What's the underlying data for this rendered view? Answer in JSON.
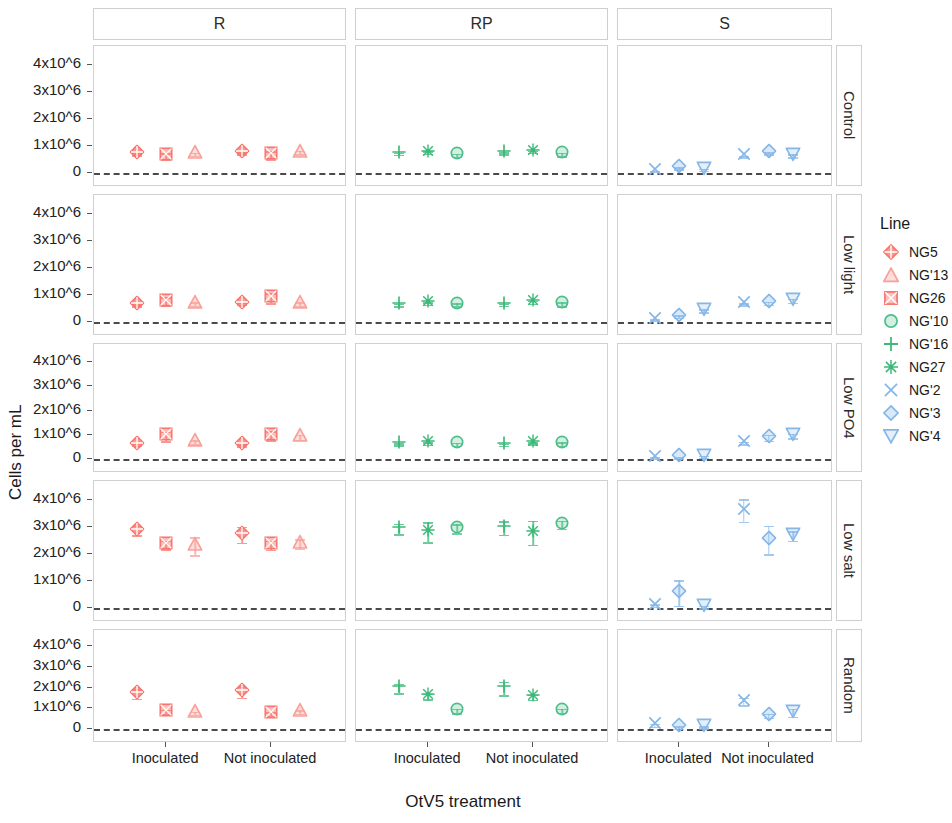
{
  "figure": {
    "axis_title_x": "OtV5 treatment",
    "axis_title_y": "Cells per mL",
    "legend_title": "Line"
  },
  "chart_data": {
    "type": "scatter",
    "title": "",
    "xlabel": "OtV5 treatment",
    "ylabel": "Cells per mL",
    "ylim": [
      0,
      4500000
    ],
    "yticks": [
      0,
      1000000,
      2000000,
      3000000,
      4000000
    ],
    "ytick_labels": [
      "0",
      "1x10^6",
      "2x10^6",
      "3x10^6",
      "4x10^6"
    ],
    "x_categories": [
      "Inoculated",
      "Not inoculated"
    ],
    "grid": false,
    "legend_position": "right",
    "reference_line": {
      "y": 0,
      "style": "dashed",
      "color": "#4a4a4a"
    },
    "facet_columns": [
      "R",
      "RP",
      "S"
    ],
    "facet_rows": [
      "Control",
      "Low light",
      "Low PO4",
      "Low salt",
      "Random"
    ],
    "legend": [
      {
        "name": "NG5",
        "marker": "diamond-plus",
        "color": "#F8766D",
        "filled": true
      },
      {
        "name": "NG'13",
        "marker": "triangle",
        "color": "#F8A19B",
        "filled": false
      },
      {
        "name": "NG26",
        "marker": "square-x",
        "color": "#F8766D",
        "filled": false
      },
      {
        "name": "NG'10",
        "marker": "circle-open",
        "color": "#4DBE8A",
        "filled": false
      },
      {
        "name": "NG'16",
        "marker": "plus",
        "color": "#3CB878",
        "filled": true
      },
      {
        "name": "NG27",
        "marker": "asterisk",
        "color": "#3CB878",
        "filled": true
      },
      {
        "name": "NG'2",
        "marker": "x",
        "color": "#84B7E8",
        "filled": true
      },
      {
        "name": "NG'3",
        "marker": "diamond-open",
        "color": "#84B7E8",
        "filled": false
      },
      {
        "name": "NG'4",
        "marker": "triangle-down-open",
        "color": "#84B7E8",
        "filled": false
      }
    ],
    "series": [
      {
        "facet_col": "R",
        "facet_row": "Control",
        "points": [
          {
            "line": "NG5",
            "x": "Inoculated",
            "y": 700000,
            "err": 40000
          },
          {
            "line": "NG26",
            "x": "Inoculated",
            "y": 620000,
            "err": 120000
          },
          {
            "line": "NG'13",
            "x": "Inoculated",
            "y": 700000,
            "err": 60000
          },
          {
            "line": "NG5",
            "x": "Not inoculated",
            "y": 740000,
            "err": 40000
          },
          {
            "line": "NG26",
            "x": "Not inoculated",
            "y": 660000,
            "err": 140000
          },
          {
            "line": "NG'13",
            "x": "Not inoculated",
            "y": 760000,
            "err": 70000
          }
        ]
      },
      {
        "facet_col": "RP",
        "facet_row": "Control",
        "points": [
          {
            "line": "NG'16",
            "x": "Inoculated",
            "y": 720000,
            "err": 40000
          },
          {
            "line": "NG27",
            "x": "Inoculated",
            "y": 760000,
            "err": 40000
          },
          {
            "line": "NG'10",
            "x": "Inoculated",
            "y": 660000,
            "err": 60000
          },
          {
            "line": "NG'16",
            "x": "Not inoculated",
            "y": 730000,
            "err": 40000
          },
          {
            "line": "NG27",
            "x": "Not inoculated",
            "y": 790000,
            "err": 40000
          },
          {
            "line": "NG'10",
            "x": "Not inoculated",
            "y": 690000,
            "err": 70000
          }
        ]
      },
      {
        "facet_col": "S",
        "facet_row": "Control",
        "points": [
          {
            "line": "NG'2",
            "x": "Inoculated",
            "y": 60000,
            "err": 20000
          },
          {
            "line": "NG'3",
            "x": "Inoculated",
            "y": 180000,
            "err": 40000
          },
          {
            "line": "NG'4",
            "x": "Inoculated",
            "y": 120000,
            "err": 40000
          },
          {
            "line": "NG'2",
            "x": "Not inoculated",
            "y": 620000,
            "err": 30000
          },
          {
            "line": "NG'3",
            "x": "Not inoculated",
            "y": 740000,
            "err": 40000
          },
          {
            "line": "NG'4",
            "x": "Not inoculated",
            "y": 640000,
            "err": 60000
          }
        ]
      },
      {
        "facet_col": "R",
        "facet_row": "Low light",
        "points": [
          {
            "line": "NG5",
            "x": "Inoculated",
            "y": 620000,
            "err": 40000
          },
          {
            "line": "NG26",
            "x": "Inoculated",
            "y": 760000,
            "err": 160000
          },
          {
            "line": "NG'13",
            "x": "Inoculated",
            "y": 660000,
            "err": 70000
          },
          {
            "line": "NG5",
            "x": "Not inoculated",
            "y": 680000,
            "err": 40000
          },
          {
            "line": "NG26",
            "x": "Not inoculated",
            "y": 880000,
            "err": 180000
          },
          {
            "line": "NG'13",
            "x": "Not inoculated",
            "y": 660000,
            "err": 80000
          }
        ]
      },
      {
        "facet_col": "RP",
        "facet_row": "Low light",
        "points": [
          {
            "line": "NG'16",
            "x": "Inoculated",
            "y": 630000,
            "err": 40000
          },
          {
            "line": "NG27",
            "x": "Inoculated",
            "y": 690000,
            "err": 50000
          },
          {
            "line": "NG'10",
            "x": "Inoculated",
            "y": 640000,
            "err": 60000
          },
          {
            "line": "NG'16",
            "x": "Not inoculated",
            "y": 640000,
            "err": 40000
          },
          {
            "line": "NG27",
            "x": "Not inoculated",
            "y": 730000,
            "err": 60000
          },
          {
            "line": "NG'10",
            "x": "Not inoculated",
            "y": 660000,
            "err": 70000
          }
        ]
      },
      {
        "facet_col": "S",
        "facet_row": "Low light",
        "points": [
          {
            "line": "NG'2",
            "x": "Inoculated",
            "y": 70000,
            "err": 30000
          },
          {
            "line": "NG'3",
            "x": "Inoculated",
            "y": 200000,
            "err": 50000
          },
          {
            "line": "NG'4",
            "x": "Inoculated",
            "y": 420000,
            "err": 60000
          },
          {
            "line": "NG'2",
            "x": "Not inoculated",
            "y": 660000,
            "err": 40000
          },
          {
            "line": "NG'3",
            "x": "Not inoculated",
            "y": 700000,
            "err": 50000
          },
          {
            "line": "NG'4",
            "x": "Not inoculated",
            "y": 790000,
            "err": 70000
          }
        ]
      },
      {
        "facet_col": "R",
        "facet_row": "Low PO4",
        "points": [
          {
            "line": "NG5",
            "x": "Inoculated",
            "y": 580000,
            "err": 40000
          },
          {
            "line": "NG26",
            "x": "Inoculated",
            "y": 930000,
            "err": 200000
          },
          {
            "line": "NG'13",
            "x": "Inoculated",
            "y": 690000,
            "err": 80000
          },
          {
            "line": "NG5",
            "x": "Not inoculated",
            "y": 570000,
            "err": 40000
          },
          {
            "line": "NG26",
            "x": "Not inoculated",
            "y": 960000,
            "err": 190000
          },
          {
            "line": "NG'13",
            "x": "Not inoculated",
            "y": 900000,
            "err": 100000
          }
        ]
      },
      {
        "facet_col": "RP",
        "facet_row": "Low PO4",
        "points": [
          {
            "line": "NG'16",
            "x": "Inoculated",
            "y": 600000,
            "err": 40000
          },
          {
            "line": "NG27",
            "x": "Inoculated",
            "y": 640000,
            "err": 50000
          },
          {
            "line": "NG'10",
            "x": "Inoculated",
            "y": 610000,
            "err": 60000
          },
          {
            "line": "NG'16",
            "x": "Not inoculated",
            "y": 590000,
            "err": 40000
          },
          {
            "line": "NG27",
            "x": "Not inoculated",
            "y": 650000,
            "err": 50000
          },
          {
            "line": "NG'10",
            "x": "Not inoculated",
            "y": 620000,
            "err": 70000
          }
        ]
      },
      {
        "facet_col": "S",
        "facet_row": "Low PO4",
        "points": [
          {
            "line": "NG'2",
            "x": "Inoculated",
            "y": 60000,
            "err": 30000
          },
          {
            "line": "NG'3",
            "x": "Inoculated",
            "y": 70000,
            "err": 30000
          },
          {
            "line": "NG'4",
            "x": "Inoculated",
            "y": 100000,
            "err": 40000
          },
          {
            "line": "NG'2",
            "x": "Not inoculated",
            "y": 660000,
            "err": 50000
          },
          {
            "line": "NG'3",
            "x": "Not inoculated",
            "y": 880000,
            "err": 120000
          },
          {
            "line": "NG'4",
            "x": "Not inoculated",
            "y": 950000,
            "err": 90000
          }
        ]
      },
      {
        "facet_col": "R",
        "facet_row": "Low salt",
        "points": [
          {
            "line": "NG5",
            "x": "Inoculated",
            "y": 2880000,
            "err": 180000
          },
          {
            "line": "NG26",
            "x": "Inoculated",
            "y": 2340000,
            "err": 160000
          },
          {
            "line": "NG'13",
            "x": "Inoculated",
            "y": 2300000,
            "err": 330000
          },
          {
            "line": "NG5",
            "x": "Not inoculated",
            "y": 2720000,
            "err": 300000
          },
          {
            "line": "NG26",
            "x": "Not inoculated",
            "y": 2340000,
            "err": 170000
          },
          {
            "line": "NG'13",
            "x": "Not inoculated",
            "y": 2380000,
            "err": 170000
          }
        ]
      },
      {
        "facet_col": "RP",
        "facet_row": "Low salt",
        "points": [
          {
            "line": "NG'16",
            "x": "Inoculated",
            "y": 2940000,
            "err": 200000
          },
          {
            "line": "NG27",
            "x": "Inoculated",
            "y": 2820000,
            "err": 370000
          },
          {
            "line": "NG'10",
            "x": "Inoculated",
            "y": 2950000,
            "err": 170000
          },
          {
            "line": "NG'16",
            "x": "Not inoculated",
            "y": 2980000,
            "err": 250000
          },
          {
            "line": "NG27",
            "x": "Not inoculated",
            "y": 2800000,
            "err": 440000
          },
          {
            "line": "NG'10",
            "x": "Not inoculated",
            "y": 3090000,
            "err": 150000
          }
        ]
      },
      {
        "facet_col": "S",
        "facet_row": "Low salt",
        "points": [
          {
            "line": "NG'2",
            "x": "Inoculated",
            "y": 90000,
            "err": 50000
          },
          {
            "line": "NG'3",
            "x": "Inoculated",
            "y": 560000,
            "err": 480000
          },
          {
            "line": "NG'4",
            "x": "Inoculated",
            "y": 40000,
            "err": 40000
          },
          {
            "line": "NG'2",
            "x": "Not inoculated",
            "y": 3620000,
            "err": 420000
          },
          {
            "line": "NG'3",
            "x": "Not inoculated",
            "y": 2530000,
            "err": 530000
          },
          {
            "line": "NG'4",
            "x": "Not inoculated",
            "y": 2680000,
            "err": 180000
          }
        ]
      },
      {
        "facet_col": "R",
        "facet_row": "Random",
        "points": [
          {
            "line": "NG5",
            "x": "Inoculated",
            "y": 1700000,
            "err": 230000
          },
          {
            "line": "NG26",
            "x": "Inoculated",
            "y": 830000,
            "err": 100000
          },
          {
            "line": "NG'13",
            "x": "Inoculated",
            "y": 760000,
            "err": 80000
          },
          {
            "line": "NG5",
            "x": "Not inoculated",
            "y": 1780000,
            "err": 260000
          },
          {
            "line": "NG26",
            "x": "Not inoculated",
            "y": 720000,
            "err": 100000
          },
          {
            "line": "NG'13",
            "x": "Not inoculated",
            "y": 820000,
            "err": 90000
          }
        ]
      },
      {
        "facet_col": "RP",
        "facet_row": "Random",
        "points": [
          {
            "line": "NG'16",
            "x": "Inoculated",
            "y": 1960000,
            "err": 220000
          },
          {
            "line": "NG27",
            "x": "Inoculated",
            "y": 1580000,
            "err": 130000
          },
          {
            "line": "NG'10",
            "x": "Inoculated",
            "y": 880000,
            "err": 110000
          },
          {
            "line": "NG'16",
            "x": "Not inoculated",
            "y": 1960000,
            "err": 330000
          },
          {
            "line": "NG27",
            "x": "Not inoculated",
            "y": 1540000,
            "err": 120000
          },
          {
            "line": "NG'10",
            "x": "Not inoculated",
            "y": 880000,
            "err": 90000
          }
        ]
      },
      {
        "facet_col": "S",
        "facet_row": "Random",
        "points": [
          {
            "line": "NG'2",
            "x": "Inoculated",
            "y": 180000,
            "err": 80000
          },
          {
            "line": "NG'3",
            "x": "Inoculated",
            "y": 80000,
            "err": 60000
          },
          {
            "line": "NG'4",
            "x": "Inoculated",
            "y": 90000,
            "err": 50000
          },
          {
            "line": "NG'2",
            "x": "Not inoculated",
            "y": 1330000,
            "err": 180000
          },
          {
            "line": "NG'3",
            "x": "Not inoculated",
            "y": 640000,
            "err": 90000
          },
          {
            "line": "NG'4",
            "x": "Not inoculated",
            "y": 790000,
            "err": 190000
          }
        ]
      }
    ]
  }
}
